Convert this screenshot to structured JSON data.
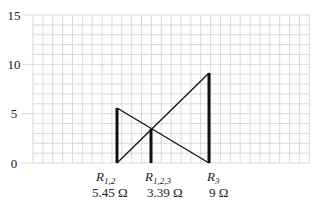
{
  "diagram": {
    "y_axis": {
      "ticks": [
        "0",
        "5",
        "10",
        "15"
      ],
      "min": 0,
      "max": 15
    },
    "grid_color": "#d9d9d9",
    "line_color": "#111111",
    "resistors": [
      {
        "symbol": "R",
        "subscript": "1,2",
        "value_label": "5.45 Ω",
        "height": 5.45
      },
      {
        "symbol": "R",
        "subscript": "1,2,3",
        "value_label": "3.39 Ω",
        "height": 3.39
      },
      {
        "symbol": "R",
        "subscript": "3",
        "value_label": "9 Ω",
        "height": 9
      }
    ]
  }
}
